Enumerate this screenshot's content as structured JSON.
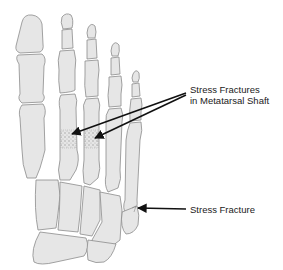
{
  "diagram": {
    "labels": {
      "metatarsal_shaft": {
        "line1": "Stress Fractures",
        "line2": "in Metatarsal Shaft"
      },
      "fifth_metatarsal": {
        "text": "Stress Fracture"
      }
    },
    "colors": {
      "bone_fill": "#e6e6e6",
      "bone_outline": "#8c8c8c",
      "arrow": "#111111",
      "background": "#ffffff"
    }
  }
}
